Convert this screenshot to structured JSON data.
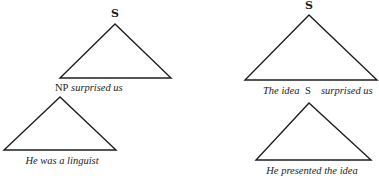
{
  "trees": [
    {
      "id": "matrix-left",
      "root_label": "S",
      "yield": [
        {
          "text": "NP",
          "style": "roman"
        },
        {
          "text": " surprised us",
          "style": "italic"
        }
      ]
    },
    {
      "id": "embedded-left",
      "root_label": "",
      "yield": [
        {
          "text": "He was a linguist",
          "style": "italic"
        }
      ]
    },
    {
      "id": "matrix-right",
      "root_label": "S",
      "yield": [
        {
          "text": "The idea",
          "style": "italic"
        },
        {
          "text": "S",
          "style": "roman"
        },
        {
          "text": "surprised us",
          "style": "italic"
        }
      ]
    },
    {
      "id": "embedded-right",
      "root_label": "",
      "yield": [
        {
          "text": "He presented the idea",
          "style": "italic"
        }
      ]
    }
  ]
}
